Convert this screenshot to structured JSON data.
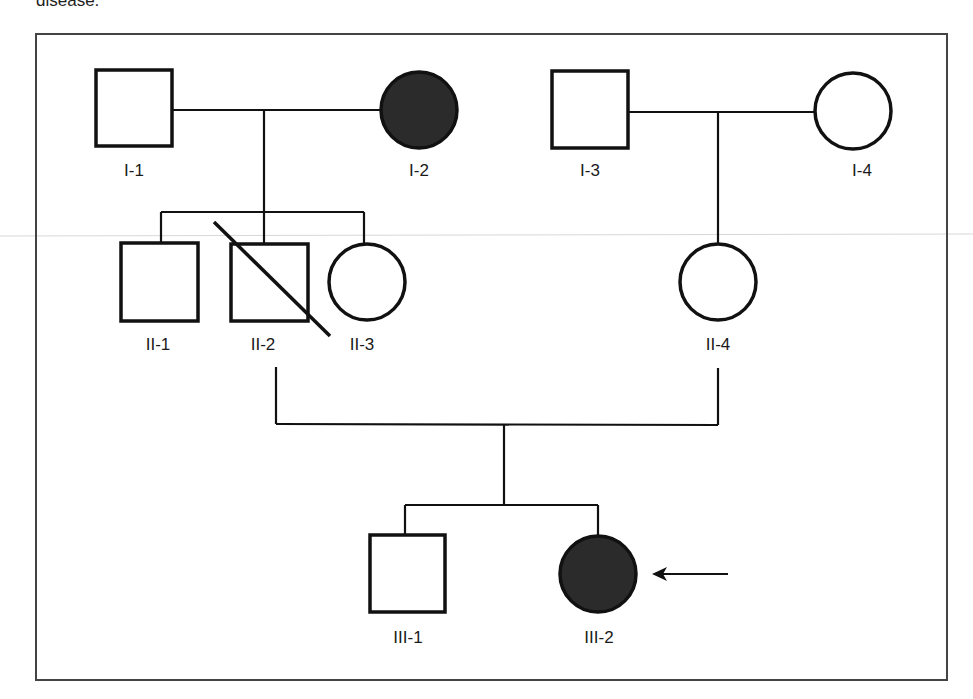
{
  "caption_fragment": "disease.",
  "legend": {
    "affected_fill": "#2b2b2b",
    "unaffected_fill": "#ffffff",
    "line_color": "#111111"
  },
  "individuals": [
    {
      "id": "I-1",
      "generation": "I",
      "sex": "male",
      "affected": false,
      "deceased": false
    },
    {
      "id": "I-2",
      "generation": "I",
      "sex": "female",
      "affected": true,
      "deceased": false
    },
    {
      "id": "I-3",
      "generation": "I",
      "sex": "male",
      "affected": false,
      "deceased": false
    },
    {
      "id": "I-4",
      "generation": "I",
      "sex": "female",
      "affected": false,
      "deceased": false
    },
    {
      "id": "II-1",
      "generation": "II",
      "sex": "male",
      "affected": false,
      "deceased": false
    },
    {
      "id": "II-2",
      "generation": "II",
      "sex": "male",
      "affected": false,
      "deceased": true
    },
    {
      "id": "II-3",
      "generation": "II",
      "sex": "female",
      "affected": false,
      "deceased": false
    },
    {
      "id": "II-4",
      "generation": "II",
      "sex": "female",
      "affected": false,
      "deceased": false
    },
    {
      "id": "III-1",
      "generation": "III",
      "sex": "male",
      "affected": false,
      "deceased": false
    },
    {
      "id": "III-2",
      "generation": "III",
      "sex": "female",
      "affected": true,
      "deceased": false,
      "proband": true
    }
  ],
  "matings": [
    {
      "partners": [
        "I-1",
        "I-2"
      ],
      "children": [
        "II-1",
        "II-2",
        "II-3"
      ]
    },
    {
      "partners": [
        "I-3",
        "I-4"
      ],
      "children": [
        "II-4"
      ]
    },
    {
      "partners": [
        "II-2",
        "II-4"
      ],
      "children": [
        "III-1",
        "III-2"
      ]
    }
  ],
  "proband_indicator": "arrow"
}
